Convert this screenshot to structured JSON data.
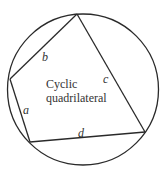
{
  "diagram": {
    "title_line1": "Cyclic",
    "title_line2": "quadrilateral",
    "sides": {
      "a": "a",
      "b": "b",
      "c": "c",
      "d": "d"
    },
    "colors": {
      "stroke": "#2a2a2a",
      "text": "#333333",
      "background": "#ffffff"
    }
  }
}
